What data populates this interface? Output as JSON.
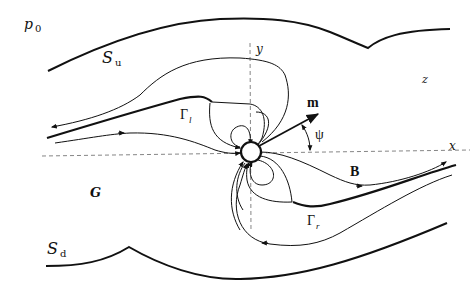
{
  "figure": {
    "labels": {
      "p0": {
        "main": "p",
        "sub": "0"
      },
      "Su": {
        "main": "S",
        "sub": "u"
      },
      "Sd": {
        "main": "S",
        "sub": "d"
      },
      "gamma_l": {
        "main": "Γ",
        "sub": "l"
      },
      "gamma_r": {
        "main": "Γ",
        "sub": "r"
      },
      "y_axis": "y",
      "x_axis": "x",
      "z": "z",
      "m": "m",
      "psi": "ψ",
      "B": "B",
      "G": "G"
    },
    "colors": {
      "ink": "#111111",
      "axis": "#777777",
      "background": "#ffffff"
    }
  }
}
